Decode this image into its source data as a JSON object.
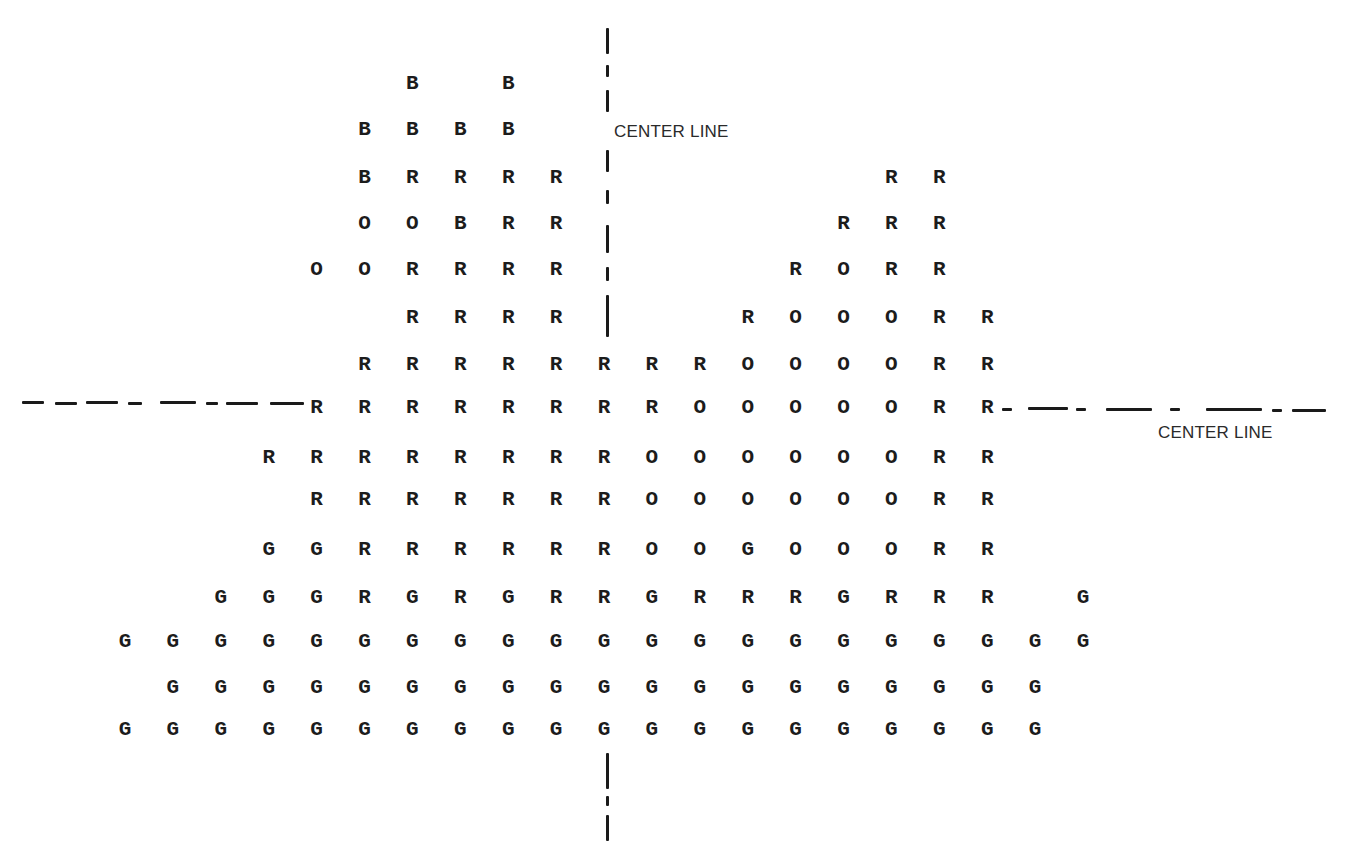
{
  "diagram": {
    "legend_codes": [
      "B",
      "R",
      "O",
      "G"
    ],
    "vertical_center_line": {
      "label": "CENTER LINE",
      "x": 607
    },
    "horizontal_center_line": {
      "label": "CENTER LINE",
      "y": 405
    },
    "grid": {
      "col_origin_x": 125,
      "col_step": 47.9,
      "rows": [
        {
          "y": 84,
          "cells": [
            [
              6,
              "B"
            ],
            [
              8,
              "B"
            ]
          ]
        },
        {
          "y": 130,
          "cells": [
            [
              5,
              "B"
            ],
            [
              6,
              "B"
            ],
            [
              7,
              "B"
            ],
            [
              8,
              "B"
            ]
          ]
        },
        {
          "y": 178,
          "cells": [
            [
              5,
              "B"
            ],
            [
              6,
              "R"
            ],
            [
              7,
              "R"
            ],
            [
              8,
              "R"
            ],
            [
              9,
              "R"
            ],
            [
              16,
              "R"
            ],
            [
              17,
              "R"
            ]
          ]
        },
        {
          "y": 224,
          "cells": [
            [
              5,
              "O"
            ],
            [
              6,
              "O"
            ],
            [
              7,
              "B"
            ],
            [
              8,
              "R"
            ],
            [
              9,
              "R"
            ],
            [
              15,
              "R"
            ],
            [
              16,
              "R"
            ],
            [
              17,
              "R"
            ]
          ]
        },
        {
          "y": 270,
          "cells": [
            [
              4,
              "O"
            ],
            [
              5,
              "O"
            ],
            [
              6,
              "R"
            ],
            [
              7,
              "R"
            ],
            [
              8,
              "R"
            ],
            [
              9,
              "R"
            ],
            [
              14,
              "R"
            ],
            [
              15,
              "O"
            ],
            [
              16,
              "R"
            ],
            [
              17,
              "R"
            ]
          ]
        },
        {
          "y": 318,
          "cells": [
            [
              6,
              "R"
            ],
            [
              7,
              "R"
            ],
            [
              8,
              "R"
            ],
            [
              9,
              "R"
            ],
            [
              13,
              "R"
            ],
            [
              14,
              "O"
            ],
            [
              15,
              "O"
            ],
            [
              16,
              "O"
            ],
            [
              17,
              "R"
            ],
            [
              18,
              "R"
            ]
          ]
        },
        {
          "y": 365,
          "cells": [
            [
              5,
              "R"
            ],
            [
              6,
              "R"
            ],
            [
              7,
              "R"
            ],
            [
              8,
              "R"
            ],
            [
              9,
              "R"
            ],
            [
              10,
              "R"
            ],
            [
              11,
              "R"
            ],
            [
              12,
              "R"
            ],
            [
              13,
              "O"
            ],
            [
              14,
              "O"
            ],
            [
              15,
              "O"
            ],
            [
              16,
              "O"
            ],
            [
              17,
              "R"
            ],
            [
              18,
              "R"
            ]
          ]
        },
        {
          "y": 408,
          "cells": [
            [
              4,
              "R"
            ],
            [
              5,
              "R"
            ],
            [
              6,
              "R"
            ],
            [
              7,
              "R"
            ],
            [
              8,
              "R"
            ],
            [
              9,
              "R"
            ],
            [
              10,
              "R"
            ],
            [
              11,
              "R"
            ],
            [
              12,
              "O"
            ],
            [
              13,
              "O"
            ],
            [
              14,
              "O"
            ],
            [
              15,
              "O"
            ],
            [
              16,
              "O"
            ],
            [
              17,
              "R"
            ],
            [
              18,
              "R"
            ]
          ]
        },
        {
          "y": 458,
          "cells": [
            [
              3,
              "R"
            ],
            [
              4,
              "R"
            ],
            [
              5,
              "R"
            ],
            [
              6,
              "R"
            ],
            [
              7,
              "R"
            ],
            [
              8,
              "R"
            ],
            [
              9,
              "R"
            ],
            [
              10,
              "R"
            ],
            [
              11,
              "O"
            ],
            [
              12,
              "O"
            ],
            [
              13,
              "O"
            ],
            [
              14,
              "O"
            ],
            [
              15,
              "O"
            ],
            [
              16,
              "O"
            ],
            [
              17,
              "R"
            ],
            [
              18,
              "R"
            ]
          ]
        },
        {
          "y": 500,
          "cells": [
            [
              4,
              "R"
            ],
            [
              5,
              "R"
            ],
            [
              6,
              "R"
            ],
            [
              7,
              "R"
            ],
            [
              8,
              "R"
            ],
            [
              9,
              "R"
            ],
            [
              10,
              "R"
            ],
            [
              11,
              "O"
            ],
            [
              12,
              "O"
            ],
            [
              13,
              "O"
            ],
            [
              14,
              "O"
            ],
            [
              15,
              "O"
            ],
            [
              16,
              "O"
            ],
            [
              17,
              "R"
            ],
            [
              18,
              "R"
            ]
          ]
        },
        {
          "y": 550,
          "cells": [
            [
              3,
              "G"
            ],
            [
              4,
              "G"
            ],
            [
              5,
              "R"
            ],
            [
              6,
              "R"
            ],
            [
              7,
              "R"
            ],
            [
              8,
              "R"
            ],
            [
              9,
              "R"
            ],
            [
              10,
              "R"
            ],
            [
              11,
              "O"
            ],
            [
              12,
              "O"
            ],
            [
              13,
              "G"
            ],
            [
              14,
              "O"
            ],
            [
              15,
              "O"
            ],
            [
              16,
              "O"
            ],
            [
              17,
              "R"
            ],
            [
              18,
              "R"
            ]
          ]
        },
        {
          "y": 598,
          "cells": [
            [
              2,
              "G"
            ],
            [
              3,
              "G"
            ],
            [
              4,
              "G"
            ],
            [
              5,
              "R"
            ],
            [
              6,
              "G"
            ],
            [
              7,
              "R"
            ],
            [
              8,
              "G"
            ],
            [
              9,
              "R"
            ],
            [
              10,
              "R"
            ],
            [
              11,
              "G"
            ],
            [
              12,
              "R"
            ],
            [
              13,
              "R"
            ],
            [
              14,
              "R"
            ],
            [
              15,
              "G"
            ],
            [
              16,
              "R"
            ],
            [
              17,
              "R"
            ],
            [
              18,
              "R"
            ],
            [
              20,
              "G"
            ]
          ]
        },
        {
          "y": 642,
          "cells": [
            [
              0,
              "G"
            ],
            [
              1,
              "G"
            ],
            [
              2,
              "G"
            ],
            [
              3,
              "G"
            ],
            [
              4,
              "G"
            ],
            [
              5,
              "G"
            ],
            [
              6,
              "G"
            ],
            [
              7,
              "G"
            ],
            [
              8,
              "G"
            ],
            [
              9,
              "G"
            ],
            [
              10,
              "G"
            ],
            [
              11,
              "G"
            ],
            [
              12,
              "G"
            ],
            [
              13,
              "G"
            ],
            [
              14,
              "G"
            ],
            [
              15,
              "G"
            ],
            [
              16,
              "G"
            ],
            [
              17,
              "G"
            ],
            [
              18,
              "G"
            ],
            [
              19,
              "G"
            ],
            [
              20,
              "G"
            ]
          ]
        },
        {
          "y": 688,
          "cells": [
            [
              1,
              "G"
            ],
            [
              2,
              "G"
            ],
            [
              3,
              "G"
            ],
            [
              4,
              "G"
            ],
            [
              5,
              "G"
            ],
            [
              6,
              "G"
            ],
            [
              7,
              "G"
            ],
            [
              8,
              "G"
            ],
            [
              9,
              "G"
            ],
            [
              10,
              "G"
            ],
            [
              11,
              "G"
            ],
            [
              12,
              "G"
            ],
            [
              13,
              "G"
            ],
            [
              14,
              "G"
            ],
            [
              15,
              "G"
            ],
            [
              16,
              "G"
            ],
            [
              17,
              "G"
            ],
            [
              18,
              "G"
            ],
            [
              19,
              "G"
            ]
          ]
        },
        {
          "y": 730,
          "cells": [
            [
              0,
              "G"
            ],
            [
              1,
              "G"
            ],
            [
              2,
              "G"
            ],
            [
              3,
              "G"
            ],
            [
              4,
              "G"
            ],
            [
              5,
              "G"
            ],
            [
              6,
              "G"
            ],
            [
              7,
              "G"
            ],
            [
              8,
              "G"
            ],
            [
              9,
              "G"
            ],
            [
              10,
              "G"
            ],
            [
              11,
              "G"
            ],
            [
              12,
              "G"
            ],
            [
              13,
              "G"
            ],
            [
              14,
              "G"
            ],
            [
              15,
              "G"
            ],
            [
              16,
              "G"
            ],
            [
              17,
              "G"
            ],
            [
              18,
              "G"
            ],
            [
              19,
              "G"
            ]
          ]
        }
      ]
    }
  }
}
